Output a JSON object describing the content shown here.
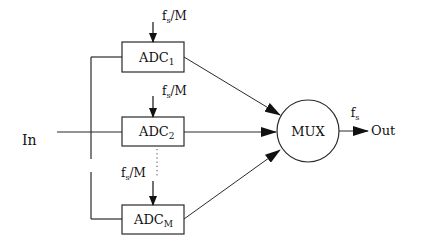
{
  "diagram": {
    "type": "block-diagram",
    "input": {
      "label": "In"
    },
    "output": {
      "label": "Out",
      "rate_label": {
        "base": "f",
        "sub": "s"
      }
    },
    "clock_label": {
      "base": "f",
      "sub": "s",
      "suffix": "/M"
    },
    "adcs": [
      {
        "base": "ADC",
        "sub": "1"
      },
      {
        "base": "ADC",
        "sub": "2"
      },
      {
        "base": "ADC",
        "sub": "M"
      }
    ],
    "mux": {
      "label": "MUX"
    },
    "ellipsis": "vertical dots between ADC2 and ADCM",
    "colors": {
      "line": "#2a2a2a",
      "background": "#ffffff"
    }
  }
}
